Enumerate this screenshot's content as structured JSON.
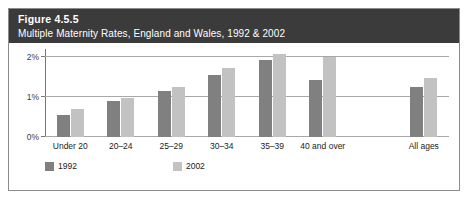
{
  "figure": {
    "number": "Figure 4.5.5",
    "title": "Multiple Maternity Rates, England and Wales, 1992 & 2002"
  },
  "colors": {
    "header_background": "#3b3b3b",
    "header_text": "#ffffff",
    "series_1992": "#808080",
    "series_2002": "#c2c2c2",
    "gridline": "#a8a8a8",
    "border": "#8c8c8c"
  },
  "chart_data": {
    "type": "bar",
    "title": "Multiple Maternity Rates, England and Wales, 1992 & 2002",
    "xlabel": "",
    "ylabel": "",
    "ylim": [
      0,
      2.2
    ],
    "yticks": [
      0,
      1,
      2
    ],
    "ytick_labels": [
      "0%",
      "1%",
      "2%"
    ],
    "grid": true,
    "legend_position": "bottom-left",
    "categories": [
      "Under 20",
      "20–24",
      "25–29",
      "30–34",
      "35–39",
      "40 and over",
      "",
      "All ages"
    ],
    "series": [
      {
        "name": "1992",
        "color": "#808080",
        "values": [
          0.55,
          0.9,
          1.15,
          1.55,
          1.92,
          1.42,
          null,
          1.25
        ]
      },
      {
        "name": "2002",
        "color": "#c2c2c2",
        "values": [
          0.7,
          0.98,
          1.25,
          1.72,
          2.08,
          2.0,
          null,
          1.48
        ]
      }
    ]
  },
  "legend": {
    "items": [
      {
        "label": "1992"
      },
      {
        "label": "2002"
      }
    ]
  }
}
